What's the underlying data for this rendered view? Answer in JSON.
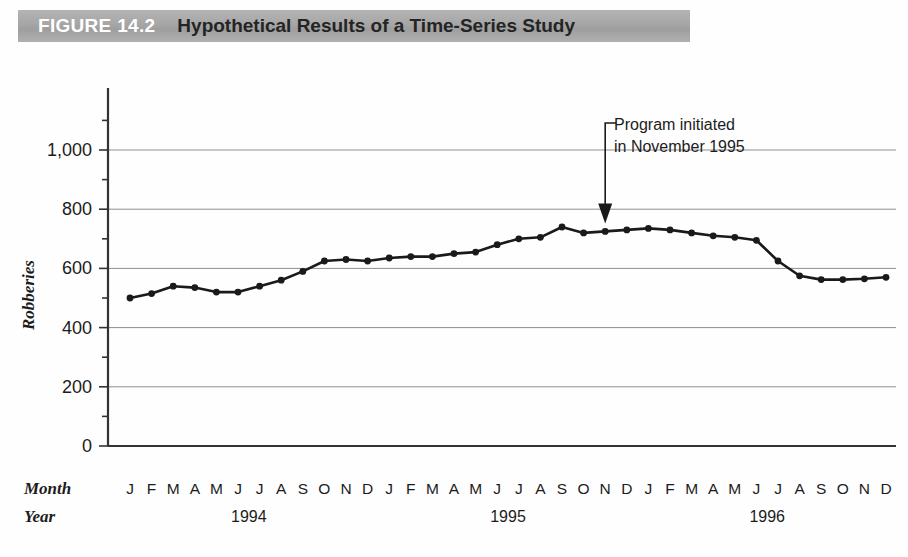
{
  "header": {
    "figure_number": "FIGURE 14.2",
    "title": "Hypothetical Results of a Time-Series Study",
    "banner_color": "#a6a6a6",
    "figure_number_color": "#ffffff",
    "title_color": "#242424"
  },
  "axis": {
    "y_title": "Robberies",
    "month_row_label": "Month",
    "year_row_label": "Year"
  },
  "annotation": {
    "line1": "Program initiated",
    "line2": "in November 1995"
  },
  "chart_data": {
    "type": "line",
    "title": "Hypothetical Results of a Time-Series Study",
    "xlabel": "Month / Year",
    "ylabel": "Robberies",
    "ylim": [
      0,
      1000
    ],
    "yticks": [
      0,
      200,
      400,
      600,
      800,
      1000
    ],
    "ytick_labels": [
      "0",
      "200",
      "400",
      "600",
      "800",
      "1,000"
    ],
    "grid": true,
    "legend": false,
    "line_color": "#1a1a1a",
    "marker": "circle",
    "month_letters": [
      "J",
      "F",
      "M",
      "A",
      "M",
      "J",
      "J",
      "A",
      "S",
      "O",
      "N",
      "D"
    ],
    "years": [
      "1994",
      "1995",
      "1996"
    ],
    "x": [
      "1994-J",
      "1994-F",
      "1994-M",
      "1994-A",
      "1994-M",
      "1994-J",
      "1994-J",
      "1994-A",
      "1994-S",
      "1994-O",
      "1994-N",
      "1994-D",
      "1995-J",
      "1995-F",
      "1995-M",
      "1995-A",
      "1995-M",
      "1995-J",
      "1995-J",
      "1995-A",
      "1995-S",
      "1995-O",
      "1995-N",
      "1995-D",
      "1996-J",
      "1996-F",
      "1996-M",
      "1996-A",
      "1996-M",
      "1996-J",
      "1996-J",
      "1996-A",
      "1996-S",
      "1996-O",
      "1996-N",
      "1996-D"
    ],
    "values": [
      500,
      515,
      540,
      535,
      520,
      520,
      540,
      560,
      590,
      625,
      630,
      625,
      635,
      640,
      640,
      650,
      655,
      680,
      700,
      705,
      740,
      720,
      725,
      730,
      735,
      730,
      720,
      710,
      705,
      695,
      625,
      575,
      562,
      562,
      565,
      570
    ],
    "annotations": [
      {
        "text": "Program initiated in November 1995",
        "points_to": "1995-N",
        "value_at_point": 725,
        "arrow": "down"
      }
    ]
  }
}
